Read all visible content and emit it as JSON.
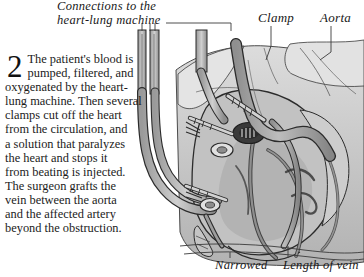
{
  "figure": {
    "step_number": "2",
    "body_text": "The patient's blood is\npumped, filtered, and\noxygenated by the heart-\nlung machine. Then several\nclamps cut off the heart\nfrom the circulation, and\na solution that paralyzes\nthe heart and stops it\nfrom beating is injected.\nThe surgeon grafts the\nvein between the aorta\nand the affected artery\nbeyond the obstruction."
  },
  "labels": {
    "connections_line1": "Connections to the",
    "connections_line2": "heart-lung machine",
    "clamp": "Clamp",
    "aorta": "Aorta",
    "narrowed": "Narrowed",
    "length_of_vein": "Length of vein"
  },
  "colors": {
    "page_background": "#ffffff",
    "ink": "#1b1b1b",
    "outline": "#2b2b2b",
    "tissue_light": "#d7d7d7",
    "tissue_mid": "#b9b9b9",
    "tissue_dark": "#9b9b9b",
    "vessel_gray": "#a6a6a6",
    "vessel_dark": "#7d7d7d",
    "anastomosis_dark": "#3a3a3a",
    "leader_line": "#3a3a3a"
  }
}
